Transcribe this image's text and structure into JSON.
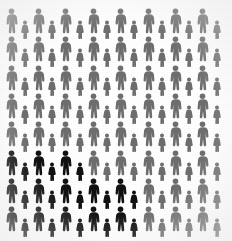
{
  "canvas": {
    "width": 232,
    "height": 241,
    "background_color": "#ffffff"
  },
  "colors": {
    "majority_figure": "#6e6e6e",
    "highlighted_figure": "#111111",
    "background": "#ffffff"
  },
  "chart_data": {
    "type": "pictogram",
    "title": "",
    "subtitle": "",
    "xlabel": "",
    "ylabel": "",
    "unit_label": "person",
    "rows": 8,
    "columns": 16,
    "total_figures": 128,
    "highlighted_count": 26,
    "majority_count": 102,
    "highlighted_share_percent": 20,
    "legend": [
      {
        "name": "highlighted",
        "color": "#111111",
        "count": 26
      },
      {
        "name": "remainder",
        "color": "#6e6e6e",
        "count": 102
      }
    ],
    "figure_alternation": [
      "male",
      "female"
    ],
    "highlight_region": "bottom-left",
    "grid": [
      [
        "m",
        "f",
        "m",
        "f",
        "m",
        "f",
        "m",
        "f",
        "m",
        "f",
        "m",
        "f",
        "m",
        "f",
        "m",
        "f"
      ],
      [
        "m",
        "f",
        "m",
        "f",
        "m",
        "f",
        "m",
        "f",
        "m",
        "f",
        "m",
        "f",
        "m",
        "f",
        "m",
        "f"
      ],
      [
        "m",
        "f",
        "m",
        "f",
        "m",
        "f",
        "m",
        "f",
        "m",
        "f",
        "m",
        "f",
        "m",
        "f",
        "m",
        "f"
      ],
      [
        "m",
        "f",
        "m",
        "f",
        "m",
        "f",
        "m",
        "f",
        "m",
        "f",
        "m",
        "f",
        "m",
        "f",
        "m",
        "f"
      ],
      [
        "m",
        "f",
        "m",
        "f",
        "m",
        "f",
        "m",
        "f",
        "m",
        "f",
        "m",
        "f",
        "m",
        "f",
        "m",
        "f"
      ],
      [
        "m",
        "f",
        "m",
        "f",
        "m",
        "f",
        "m",
        "f",
        "m",
        "f",
        "m",
        "f",
        "m",
        "f",
        "m",
        "f"
      ],
      [
        "m",
        "f",
        "m",
        "f",
        "m",
        "f",
        "m",
        "f",
        "m",
        "f",
        "m",
        "f",
        "m",
        "f",
        "m",
        "f"
      ],
      [
        "m",
        "f",
        "m",
        "f",
        "m",
        "f",
        "m",
        "f",
        "m",
        "f",
        "m",
        "f",
        "m",
        "f",
        "m",
        "f"
      ]
    ],
    "highlight_mask": [
      [
        0,
        0,
        0,
        0,
        0,
        0,
        0,
        0,
        0,
        0,
        0,
        0,
        0,
        0,
        0,
        0
      ],
      [
        0,
        0,
        0,
        0,
        0,
        0,
        0,
        0,
        0,
        0,
        0,
        0,
        0,
        0,
        0,
        0
      ],
      [
        0,
        0,
        0,
        0,
        0,
        0,
        0,
        0,
        0,
        0,
        0,
        0,
        0,
        0,
        0,
        0
      ],
      [
        0,
        0,
        0,
        0,
        0,
        0,
        0,
        0,
        0,
        0,
        0,
        0,
        0,
        0,
        0,
        0
      ],
      [
        0,
        0,
        0,
        0,
        0,
        0,
        0,
        0,
        0,
        0,
        0,
        0,
        0,
        0,
        0,
        0
      ],
      [
        1,
        1,
        1,
        1,
        1,
        1,
        0,
        0,
        0,
        0,
        0,
        0,
        0,
        0,
        0,
        0
      ],
      [
        1,
        1,
        1,
        1,
        1,
        1,
        1,
        1,
        1,
        1,
        0,
        0,
        0,
        0,
        0,
        0
      ],
      [
        1,
        1,
        1,
        1,
        1,
        1,
        1,
        1,
        1,
        1,
        0,
        0,
        0,
        0,
        0,
        0
      ]
    ]
  },
  "accessibility": {
    "figure_name_male": "male-person-icon",
    "figure_name_female": "female-person-icon"
  }
}
